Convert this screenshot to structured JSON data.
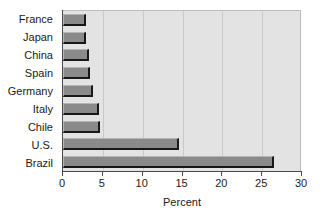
{
  "chart_data": {
    "type": "bar",
    "orientation": "horizontal",
    "title": "",
    "xlabel": "Percent",
    "ylabel": "",
    "categories": [
      "France",
      "Japan",
      "China",
      "Spain",
      "Germany",
      "Italy",
      "Chile",
      "U.S.",
      "Brazil"
    ],
    "values": [
      2.9,
      2.9,
      3.3,
      3.4,
      3.8,
      4.5,
      4.7,
      14.6,
      26.5
    ],
    "xlim": [
      0,
      30
    ],
    "xticks": [
      0,
      5,
      10,
      15,
      20,
      25,
      30
    ],
    "xtick_labels": [
      "0",
      "5",
      "10",
      "15",
      "20",
      "25",
      "30"
    ],
    "grid": "vertical",
    "legend": null,
    "colors": {
      "bar_fill": "#8a8a8a",
      "bar_edge": "#181818",
      "plot_background": "#e3e3e3",
      "gridline": "#c9c9c9",
      "axis": "#4a4a4a",
      "text": "#1a1a1a",
      "page_background": "#ffffff"
    }
  }
}
